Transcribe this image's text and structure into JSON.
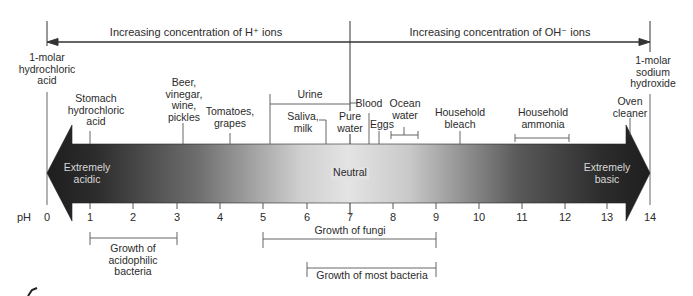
{
  "header": {
    "acid_direction_label": "Increasing concentration of H⁺ ions",
    "base_direction_label": "Increasing concentration of OH⁻ ions"
  },
  "scale": {
    "axis_label": "pH",
    "ticks": [
      "0",
      "1",
      "2",
      "3",
      "4",
      "5",
      "6",
      "7",
      "8",
      "9",
      "10",
      "11",
      "12",
      "13",
      "14"
    ]
  },
  "arrow": {
    "left_label_line1": "Extremely",
    "left_label_line2": "acidic",
    "center_label": "Neutral",
    "right_label_line1": "Extremely",
    "right_label_line2": "basic"
  },
  "substances": [
    {
      "lines": [
        "1-molar",
        "hydrochloric",
        "acid"
      ],
      "ph": 0
    },
    {
      "lines": [
        "Stomach",
        "hydrochloric",
        "acid"
      ],
      "ph": 1
    },
    {
      "lines": [
        "Beer,",
        "vinegar,",
        "wine,",
        "pickles"
      ],
      "ph": 3.2
    },
    {
      "lines": [
        "Tomatoes,",
        "grapes"
      ],
      "ph": 4.3
    },
    {
      "lines": [
        "Urine"
      ],
      "ph_range": [
        5.2,
        7
      ]
    },
    {
      "lines": [
        "Saliva,",
        "milk"
      ],
      "ph": 6.5
    },
    {
      "lines": [
        "Pure",
        "water"
      ],
      "ph": 7
    },
    {
      "lines": [
        "Blood"
      ],
      "ph": 7.4
    },
    {
      "lines": [
        "Eggs"
      ],
      "ph": 7.7
    },
    {
      "lines": [
        "Ocean",
        "water"
      ],
      "ph_range": [
        8,
        8.6
      ]
    },
    {
      "lines": [
        "Household",
        "bleach"
      ],
      "ph": 9.6
    },
    {
      "lines": [
        "Household",
        "ammonia"
      ],
      "ph_range": [
        10.8,
        12.1
      ]
    },
    {
      "lines": [
        "Oven",
        "cleaner"
      ],
      "ph": 13.5
    },
    {
      "lines": [
        "1-molar",
        "sodium",
        "hydroxide"
      ],
      "ph": 14
    }
  ],
  "growth_ranges": [
    {
      "lines": [
        "Growth of",
        "acidophilic",
        "bacteria"
      ],
      "ph_range": [
        1,
        3
      ]
    },
    {
      "lines": [
        "Growth of fungi"
      ],
      "ph_range": [
        5,
        9
      ]
    },
    {
      "lines": [
        "Growth of most bacteria"
      ],
      "ph_range": [
        6,
        9
      ]
    }
  ],
  "text": {
    "s0a": "1-molar",
    "s0b": "hydrochloric",
    "s0c": "acid",
    "s1a": "Stomach",
    "s1b": "hydrochloric",
    "s1c": "acid",
    "s2a": "Beer,",
    "s2b": "vinegar,",
    "s2c": "wine,",
    "s2d": "pickles",
    "s3a": "Tomatoes,",
    "s3b": "grapes",
    "s4": "Urine",
    "s5a": "Saliva,",
    "s5b": "milk",
    "s6a": "Pure",
    "s6b": "water",
    "s7": "Blood",
    "s8": "Eggs",
    "s9a": "Ocean",
    "s9b": "water",
    "s10a": "Household",
    "s10b": "bleach",
    "s11a": "Household",
    "s11b": "ammonia",
    "s12a": "Oven",
    "s12b": "cleaner",
    "s13a": "1-molar",
    "s13b": "sodium",
    "s13c": "hydroxide",
    "g0a": "Growth of",
    "g0b": "acidophilic",
    "g0c": "bacteria",
    "g1": "Growth of fungi",
    "g2": "Growth of most bacteria"
  },
  "colors": {
    "arrow_dark": "#222222",
    "arrow_light": "#e6e6e6",
    "line": "#4a4a4a",
    "text": "#2b2b2b"
  }
}
